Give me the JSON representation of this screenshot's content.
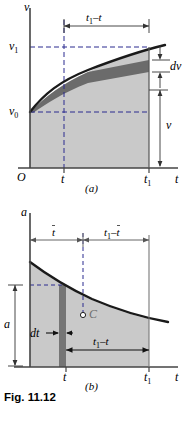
{
  "figure": {
    "caption": "Fig. 11.12",
    "panels": [
      {
        "key": "a",
        "label": "(a)",
        "yaxis_label": "v",
        "xaxis_label": "t",
        "origin_label": "O",
        "ytick_labels": [
          "v1",
          "v0"
        ],
        "xtick_labels": [
          "t",
          "t1"
        ],
        "dimensions": [
          {
            "name": "top-span",
            "label": "t1 − t"
          },
          {
            "name": "dv-strip",
            "label": "dv"
          },
          {
            "name": "v-height",
            "label": "v"
          }
        ],
        "curve": "increasing concave-down velocity curve from v0",
        "shade_color": "#c9c9c9",
        "strip_color": "#6e6e6e",
        "curve_color": "#1a1a1a",
        "dash_color": "#2b2b8f"
      },
      {
        "key": "b",
        "label": "(b)",
        "yaxis_label": "a",
        "xaxis_label": "t",
        "ytick_labels": [
          "a"
        ],
        "xtick_labels": [
          "t",
          "t1"
        ],
        "centroid_label": "C",
        "dimensions": [
          {
            "name": "tbar-span",
            "label": "t̄"
          },
          {
            "name": "t1-minus-tbar-span",
            "label": "t1 − t̄"
          },
          {
            "name": "dt-strip",
            "label": "dt"
          },
          {
            "name": "t1-minus-t-span",
            "label": "t1 − t"
          },
          {
            "name": "a-height",
            "label": "a"
          }
        ],
        "curve": "decreasing concave-up acceleration curve",
        "shade_color": "#c9c9c9",
        "strip_color": "#7a7a7a",
        "curve_color": "#1a1a1a",
        "dash_color": "#2b2b8f"
      }
    ]
  }
}
